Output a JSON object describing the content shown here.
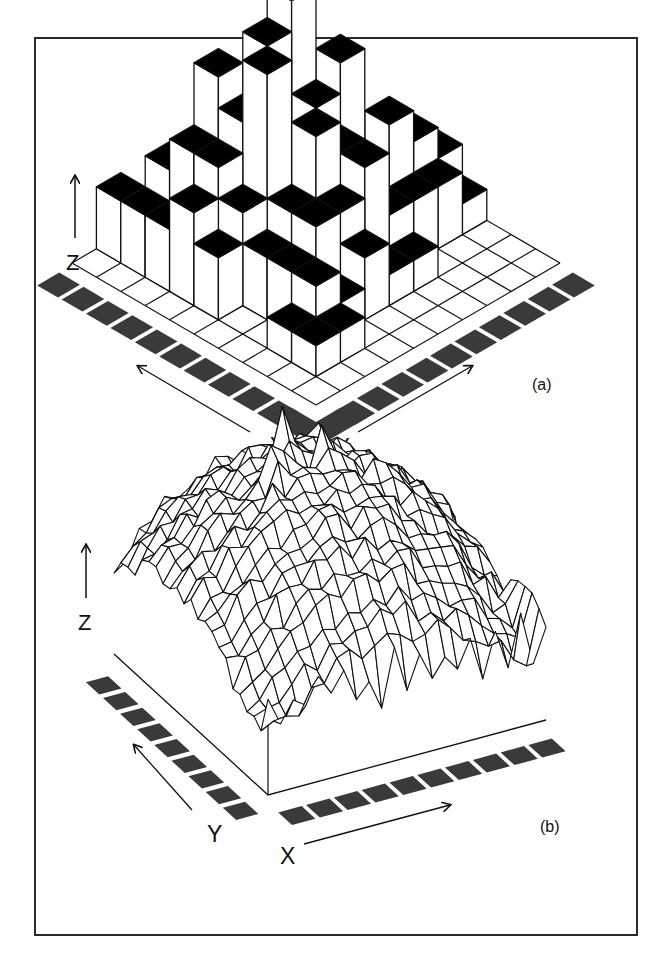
{
  "figure": {
    "panels": [
      {
        "id": "a",
        "label": "(a)",
        "axis_labels": {
          "x": "X",
          "y": "Y",
          "z": "Z"
        }
      },
      {
        "id": "b",
        "label": "(b)",
        "axis_labels": {
          "x": "X",
          "y": "Y",
          "z": "Z"
        }
      }
    ]
  },
  "colors": {
    "frame": "#2a2a2a",
    "tile": "#3a3a3a",
    "bar_top": "#000000",
    "bar_side": "#ffffff",
    "line": "#111111"
  },
  "chart_data": [
    {
      "type": "bar3d",
      "title": "(a)",
      "xlabel": "X",
      "ylabel": "Y",
      "zlabel": "Z",
      "grid_size": [
        10,
        10
      ],
      "note": "Approximate 3D histogram heights (arbitrary units), rows indexed by Y (0=front), columns by X (0=front).",
      "heights": [
        [
          0,
          0,
          0,
          0,
          0,
          0,
          0,
          0,
          0,
          0
        ],
        [
          0,
          1,
          1,
          0,
          0,
          0,
          0,
          0,
          0,
          0
        ],
        [
          0,
          1,
          2,
          1,
          2,
          1,
          1,
          0,
          0,
          0
        ],
        [
          0,
          0,
          2,
          3,
          3,
          4,
          2,
          2,
          2,
          1
        ],
        [
          0,
          0,
          2,
          3,
          5,
          4,
          3,
          4,
          3,
          2
        ],
        [
          0,
          2,
          3,
          7,
          4,
          5,
          6,
          3,
          2,
          2
        ],
        [
          0,
          3,
          4,
          5,
          7,
          8,
          4,
          2,
          2,
          0
        ],
        [
          0,
          2,
          4,
          6,
          5,
          4,
          3,
          1,
          0,
          0
        ],
        [
          0,
          2,
          3,
          2,
          3,
          1,
          0,
          0,
          0,
          0
        ],
        [
          0,
          2,
          1,
          0,
          0,
          0,
          0,
          0,
          0,
          0
        ]
      ]
    },
    {
      "type": "surface",
      "title": "(b)",
      "xlabel": "X",
      "ylabel": "Y",
      "zlabel": "Z",
      "grid_size": [
        22,
        22
      ],
      "note": "Wireframe surface: broad dome with sharp spikes near the center-back; values approximate (normalized 0-1).",
      "peak_value": 1.0,
      "edge_value": 0.35
    }
  ]
}
